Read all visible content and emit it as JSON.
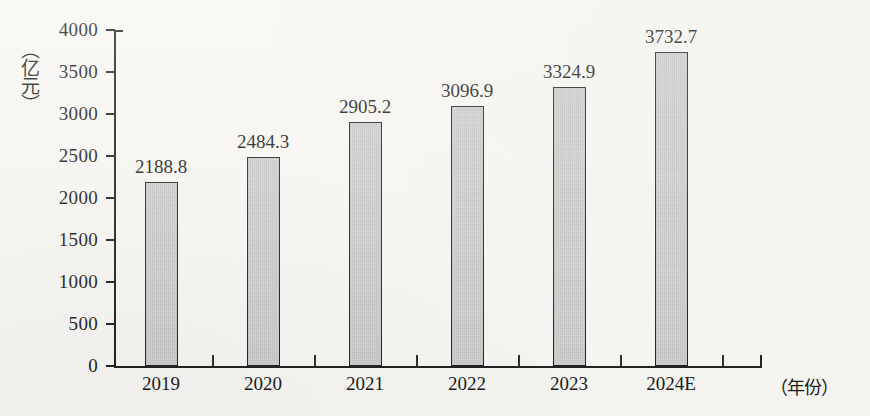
{
  "chart_data": {
    "type": "bar",
    "title": "",
    "subtitle": "",
    "xlabel": "（年份）",
    "ylabel": "（亿元）",
    "categories": [
      "2019",
      "2020",
      "2021",
      "2022",
      "2023",
      "2024E"
    ],
    "values": [
      2188.8,
      2484.3,
      2905.2,
      3096.9,
      3324.9,
      3732.7
    ],
    "value_labels": [
      "2188.8",
      "2484.3",
      "2905.2",
      "3096.9",
      "3324.9",
      "3732.7"
    ],
    "ylim": [
      0,
      4000
    ],
    "y_ticks": [
      0,
      500,
      1000,
      1500,
      2000,
      2500,
      3000,
      3500,
      4000
    ],
    "y_tick_labels": [
      "0",
      "500",
      "1000",
      "1500",
      "2000",
      "2500",
      "3000",
      "3500",
      "4000"
    ],
    "grid": false,
    "legend": false,
    "legend_position": "none",
    "bar_fill_color": "#d6d6d6",
    "bar_border_color": "#1f1f1f",
    "axis_color": "#1c1c1c",
    "text_color": "#161616",
    "background_color": "#f7f6f2"
  },
  "axes": {
    "y_axis_title": "（亿元）",
    "x_axis_title": "（年份）"
  }
}
